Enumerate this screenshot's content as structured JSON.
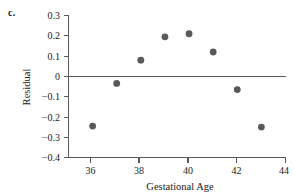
{
  "panel": {
    "label": "c."
  },
  "chart_data": {
    "type": "scatter",
    "title": "",
    "xlabel": "Gestational Age",
    "ylabel": "Residual",
    "x": [
      36,
      37,
      38,
      39,
      40,
      41,
      42,
      43
    ],
    "values": [
      -0.245,
      -0.035,
      0.08,
      0.195,
      0.21,
      0.12,
      -0.065,
      -0.25
    ],
    "series": [
      {
        "name": "Residuals",
        "points": [
          {
            "x": 36,
            "y": -0.245
          },
          {
            "x": 37,
            "y": -0.035
          },
          {
            "x": 38,
            "y": 0.08
          },
          {
            "x": 39,
            "y": 0.195
          },
          {
            "x": 40,
            "y": 0.21
          },
          {
            "x": 41,
            "y": 0.12
          },
          {
            "x": 42,
            "y": -0.065
          },
          {
            "x": 43,
            "y": -0.25
          }
        ]
      }
    ],
    "xlim": [
      35,
      44
    ],
    "ylim": [
      -0.4,
      0.3
    ],
    "xticks": [
      36,
      38,
      40,
      42,
      44
    ],
    "xtick_labels": [
      "36",
      "38",
      "40",
      "42",
      "44"
    ],
    "yticks": [
      0.3,
      0.2,
      0.1,
      0,
      -0.1,
      -0.2,
      -0.3,
      -0.4
    ],
    "ytick_labels": [
      "0.3",
      "0.2",
      "0.1",
      "0",
      "−0.1",
      "−0.2",
      "−0.3",
      "−0.4"
    ],
    "grid": false,
    "legend": false,
    "reference_lines": [
      {
        "axis": "y",
        "value": 0
      }
    ],
    "marker_color": "#595959",
    "axis_color": "#5a5a5a"
  }
}
